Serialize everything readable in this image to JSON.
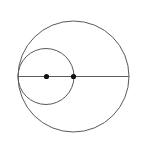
{
  "figure": {
    "kind": "geometry-diagram",
    "canvas": {
      "width": 141,
      "height": 151,
      "background_color": "#ffffff"
    },
    "style": {
      "circle_stroke_color": "#59595c",
      "circle_stroke_width": 1,
      "line_stroke_color": "#5d5d60",
      "line_stroke_width": 1.05,
      "point_fill_color": "#111111",
      "point_radius": 2.6
    },
    "circles": [
      {
        "id": "large-circle",
        "label": "large circle",
        "cx": 73.5,
        "cy": 76.5,
        "r": 55.5
      },
      {
        "id": "small-circle",
        "label": "small circle",
        "cx": 46.0,
        "cy": 76.5,
        "r": 28.0
      }
    ],
    "segments": [
      {
        "id": "horizontal-diameter",
        "label": "horizontal diameter",
        "x1": 18.0,
        "y1": 76.5,
        "x2": 129.0,
        "y2": 76.5
      }
    ],
    "points": [
      {
        "id": "small-circle-center",
        "label": "center of small circle",
        "cx": 46.5,
        "cy": 76.5,
        "r": 2.6
      },
      {
        "id": "large-circle-center",
        "label": "center of large circle",
        "cx": 73.5,
        "cy": 76.5,
        "r": 2.6
      }
    ]
  }
}
